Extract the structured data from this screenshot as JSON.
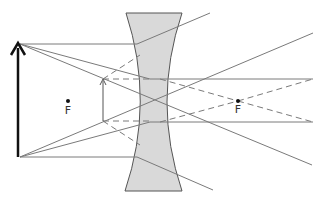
{
  "diagram": {
    "type": "ray diagram",
    "colors": {
      "background": "#ffffff",
      "lens_fill": "#d9d9d9",
      "lens_stroke": "#555555",
      "ray": "#7a7a7a",
      "object_arrow": "#111111",
      "image_arrow": "#555555",
      "focal_point": "#111111"
    },
    "focal_points": [
      {
        "label": "F",
        "x": 68,
        "y": 101
      },
      {
        "label": "F",
        "x": 238,
        "y": 101
      }
    ],
    "object": {
      "x": 18,
      "top": 43,
      "bottom": 157
    },
    "image": {
      "x": 103,
      "top": 79,
      "bottom": 121
    }
  }
}
